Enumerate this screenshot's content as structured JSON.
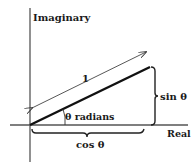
{
  "diagram": {
    "type": "unit-circle-complex-plane",
    "axes": {
      "vertical_label": "Imaginary",
      "horizontal_label": "Real"
    },
    "labels": {
      "hypotenuse": "1",
      "angle": "θ radians",
      "vertical_side": "sin θ",
      "horizontal_side": "cos θ"
    },
    "colors": {
      "ink": "#1a1a1a",
      "axis": "#555555"
    }
  }
}
